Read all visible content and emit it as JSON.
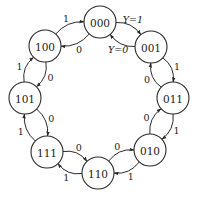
{
  "diagram": {
    "type": "state-transition-diagram",
    "nodes": [
      {
        "id": "000",
        "label": "000",
        "x": 100,
        "y": 22
      },
      {
        "id": "001",
        "label": "001",
        "x": 151,
        "y": 47
      },
      {
        "id": "011",
        "label": "011",
        "x": 173,
        "y": 98
      },
      {
        "id": "010",
        "label": "010",
        "x": 150,
        "y": 150
      },
      {
        "id": "110",
        "label": "110",
        "x": 98,
        "y": 173
      },
      {
        "id": "111",
        "label": "111",
        "x": 47,
        "y": 152
      },
      {
        "id": "101",
        "label": "101",
        "x": 25,
        "y": 98
      },
      {
        "id": "100",
        "label": "100",
        "x": 45,
        "y": 46
      }
    ],
    "node_radius": 16,
    "edges": [
      {
        "from": "000",
        "to": "001",
        "label": "Y=1",
        "side": "out",
        "italic": true
      },
      {
        "from": "001",
        "to": "000",
        "label": "Y=0",
        "side": "in",
        "italic": true
      },
      {
        "from": "001",
        "to": "011",
        "label": "1",
        "side": "out"
      },
      {
        "from": "011",
        "to": "001",
        "label": "0",
        "side": "in"
      },
      {
        "from": "011",
        "to": "010",
        "label": "1",
        "side": "out"
      },
      {
        "from": "010",
        "to": "011",
        "label": "0",
        "side": "in"
      },
      {
        "from": "010",
        "to": "110",
        "label": "1",
        "side": "out"
      },
      {
        "from": "110",
        "to": "010",
        "label": "0",
        "side": "in"
      },
      {
        "from": "110",
        "to": "111",
        "label": "1",
        "side": "out"
      },
      {
        "from": "111",
        "to": "110",
        "label": "0",
        "side": "in"
      },
      {
        "from": "111",
        "to": "101",
        "label": "1",
        "side": "out"
      },
      {
        "from": "101",
        "to": "111",
        "label": "0",
        "side": "in"
      },
      {
        "from": "101",
        "to": "100",
        "label": "1",
        "side": "out"
      },
      {
        "from": "100",
        "to": "101",
        "label": "0",
        "side": "in"
      },
      {
        "from": "100",
        "to": "000",
        "label": "1",
        "side": "out"
      },
      {
        "from": "000",
        "to": "100",
        "label": "0",
        "side": "in"
      }
    ],
    "colors": {
      "stroke": "#2a2a2a",
      "text": "#1a1a1a",
      "background": "#ffffff"
    }
  }
}
